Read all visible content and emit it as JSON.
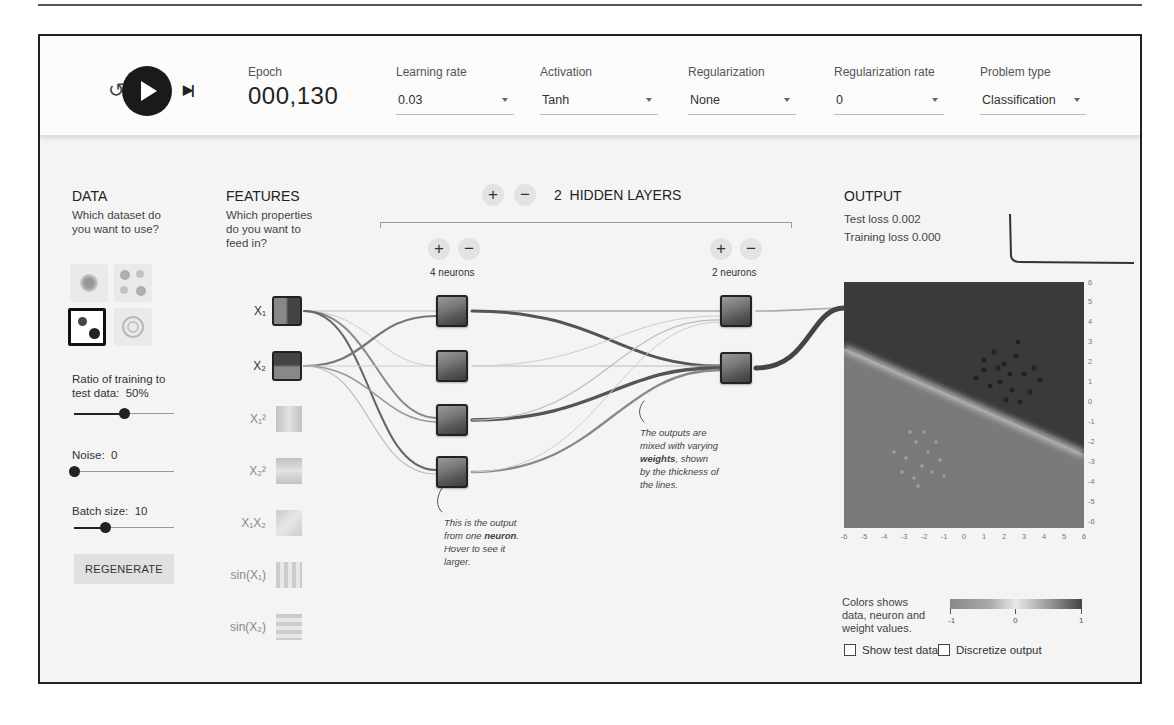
{
  "header": {
    "epoch_label": "Epoch",
    "epoch_value": "000,130",
    "controls": [
      {
        "label": "Learning rate",
        "value": "0.03"
      },
      {
        "label": "Activation",
        "value": "Tanh"
      },
      {
        "label": "Regularization",
        "value": "None"
      },
      {
        "label": "Regularization rate",
        "value": "0"
      },
      {
        "label": "Problem type",
        "value": "Classification"
      }
    ],
    "icons": {
      "reset": "reset-icon",
      "play": "play-icon",
      "step": "step-forward-icon"
    }
  },
  "data_panel": {
    "title": "DATA",
    "subtitle": "Which dataset do you want to use?",
    "datasets": [
      "circle",
      "xor",
      "gaussian",
      "spiral"
    ],
    "selected_dataset": "gaussian",
    "ratio_label": "Ratio of training to test data:",
    "ratio_value": "50%",
    "ratio_percent": 50,
    "noise_label": "Noise:",
    "noise_value": "0",
    "batch_label": "Batch size:",
    "batch_value": "10",
    "regenerate_label": "REGENERATE"
  },
  "features": {
    "title": "FEATURES",
    "subtitle": "Which properties do you want to feed in?",
    "items": [
      {
        "label": "X₁",
        "active": true
      },
      {
        "label": "X₂",
        "active": true
      },
      {
        "label": "X₁²",
        "active": false
      },
      {
        "label": "X₂²",
        "active": false
      },
      {
        "label": "X₁X₂",
        "active": false
      },
      {
        "label": "sin(X₁)",
        "active": false
      },
      {
        "label": "sin(X₂)",
        "active": false
      }
    ]
  },
  "network": {
    "layers_count": "2",
    "layers_label": "HIDDEN LAYERS",
    "add_label": "+",
    "remove_label": "−",
    "layer1_neurons": "4 neurons",
    "layer2_neurons": "2 neurons",
    "note_neuron": "This is the output from one neuron. Hover to see it larger.",
    "note_neuron_parts": [
      "This is the output",
      "from one ",
      "neuron",
      ". ",
      "Hover to see it",
      "larger."
    ],
    "note_weights_parts": [
      "The outputs are",
      "mixed with varying",
      "weights",
      ", shown",
      "by the thickness of",
      "the lines."
    ]
  },
  "output": {
    "title": "OUTPUT",
    "test_loss": "Test loss 0.002",
    "training_loss": "Training loss 0.000",
    "y_ticks": [
      "6",
      "5",
      "4",
      "3",
      "2",
      "1",
      "0",
      "-1",
      "-2",
      "-3",
      "-4",
      "-5",
      "-6"
    ],
    "x_ticks": [
      "-6",
      "-5",
      "-4",
      "-3",
      "-2",
      "-1",
      "0",
      "1",
      "2",
      "3",
      "4",
      "5",
      "6"
    ],
    "legend_text": "Colors shows data, neuron and weight values.",
    "legend_lines": [
      "Colors shows",
      "data, neuron and",
      "weight values."
    ],
    "legend_ticks": [
      "-1",
      "0",
      "1"
    ],
    "show_test_data_label": "Show test data",
    "discretize_label": "Discretize output",
    "show_test_data": false,
    "discretize": false
  }
}
